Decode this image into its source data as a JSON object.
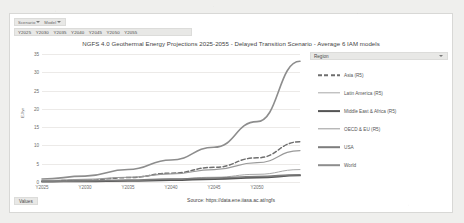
{
  "window": {
    "background_color": "#efefed",
    "panel_color": "#ffffff"
  },
  "scenario_bar": {
    "scenario_label": "Scenario",
    "model_label": "Model",
    "filter_icon": "filter-icon"
  },
  "year_bar": {
    "years": [
      "Y2025",
      "Y2030",
      "Y2035",
      "Y2040",
      "Y2045",
      "Y2050",
      "Y2055"
    ]
  },
  "footer": {
    "values_label": "Values",
    "source": "Source: https://data.ene.iiasa.ac.at/ngfs"
  },
  "legend": {
    "header_label": "Region",
    "filter_icon": "filter-icon"
  },
  "chart_data": {
    "type": "line",
    "title": "NGFS 4.0 Geothermal Energy Projections 2025-2055 - Delayed Transition Scenario - Average 6 IAM models",
    "xlabel": "",
    "ylabel": "EJ/yr",
    "x": [
      "Y2025",
      "Y2030",
      "Y2035",
      "Y2040",
      "Y2045",
      "Y2050",
      "Y2055"
    ],
    "xtick_labels": [
      "Y2025",
      "Y2030",
      "Y2035",
      "Y2040",
      "Y2045",
      "Y2050"
    ],
    "ytick_labels": [
      "35",
      "30",
      "25",
      "20",
      "15",
      "10",
      "5",
      "0"
    ],
    "ylim": [
      0,
      35
    ],
    "grid": true,
    "legend_position": "right",
    "series": [
      {
        "name": "Asia (R5)",
        "color": "#6e6e6e",
        "dash": "dashed",
        "width": 1.5,
        "values": [
          0.3,
          0.5,
          1.2,
          2.4,
          4.0,
          6.6,
          11.0
        ]
      },
      {
        "name": "Latin America (R5)",
        "color": "#a8a8a8",
        "dash": "solid",
        "width": 1.0,
        "values": [
          0.1,
          0.2,
          0.4,
          0.8,
          1.3,
          2.1,
          3.4
        ]
      },
      {
        "name": "Middle East & Africa (R5)",
        "color": "#555555",
        "dash": "solid",
        "width": 1.8,
        "values": [
          0.1,
          0.2,
          0.3,
          0.5,
          0.8,
          1.2,
          1.8
        ]
      },
      {
        "name": "OECD & EU (R5)",
        "color": "#9a9a9a",
        "dash": "solid",
        "width": 1.2,
        "values": [
          0.4,
          0.7,
          1.3,
          2.2,
          3.4,
          5.3,
          8.6
        ]
      },
      {
        "name": "USA",
        "color": "#7d7d7d",
        "dash": "solid",
        "width": 1.6,
        "values": [
          0.2,
          0.3,
          0.5,
          0.8,
          1.1,
          1.5,
          2.0
        ]
      },
      {
        "name": "World",
        "color": "#8d8d8d",
        "dash": "solid",
        "width": 1.6,
        "values": [
          0.8,
          1.6,
          3.4,
          6.0,
          9.5,
          16.5,
          33.0
        ]
      }
    ]
  }
}
